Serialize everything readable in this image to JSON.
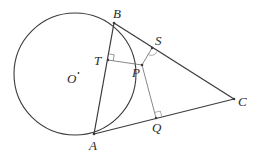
{
  "diagram": {
    "type": "geometry",
    "colors": {
      "stroke": "#3a3a3a",
      "thin_stroke": "#6a6a6a",
      "label": "#2a2a2a"
    },
    "circle": {
      "center_label": "O",
      "center_superscript": "*",
      "cx": 75,
      "cy": 74,
      "r": 61
    },
    "points": {
      "B": {
        "label": "B",
        "x": 114,
        "y": 23
      },
      "A": {
        "label": "A",
        "x": 94,
        "y": 134
      },
      "C": {
        "label": "C",
        "x": 234,
        "y": 99
      },
      "T": {
        "label": "T",
        "x": 108,
        "y": 60
      },
      "P": {
        "label": "P",
        "x": 142,
        "y": 65
      },
      "S": {
        "label": "S",
        "x": 152,
        "y": 48
      },
      "Q": {
        "label": "Q",
        "x": 156,
        "y": 118
      }
    },
    "segments": [
      "AB",
      "BC",
      "AC",
      "PT",
      "PS",
      "PQ"
    ],
    "right_angles": [
      "T",
      "S",
      "Q"
    ]
  }
}
